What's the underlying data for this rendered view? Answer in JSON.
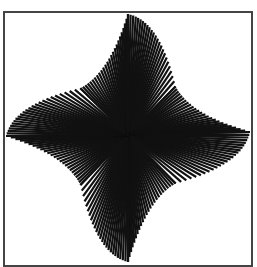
{
  "artwork": {
    "title": "",
    "description": "Black and white op-art pinwheel of radiating line fans inside a square frame",
    "ink_color": "#111111",
    "paper_color": "#ffffff",
    "frame_color": "#444444",
    "fan_count": 8,
    "lines_per_fan": 24
  }
}
